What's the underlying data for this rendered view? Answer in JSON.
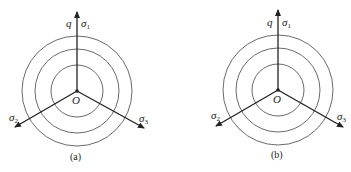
{
  "panels": [
    {
      "id": "a",
      "caption": "(a)",
      "center": [
        77,
        91
      ],
      "radii": [
        26,
        42,
        55
      ],
      "labels": {
        "q": "q",
        "sigma1": "σ",
        "sigma1_sub": "1",
        "sigma2": "σ",
        "sigma2_sub": "2",
        "sigma3": "σ",
        "sigma3_sub": "3",
        "origin": "O"
      }
    },
    {
      "id": "b",
      "caption": "(b)",
      "center": [
        278,
        90
      ],
      "radii": [
        26,
        42,
        55
      ],
      "labels": {
        "q": "q",
        "sigma1": "σ",
        "sigma1_sub": "1",
        "sigma2": "σ",
        "sigma2_sub": "2",
        "sigma3": "σ",
        "sigma3_sub": "3",
        "origin": "O"
      }
    }
  ],
  "colors": {
    "line": "#222222",
    "circle": "#444444",
    "background": "#ffffff"
  }
}
